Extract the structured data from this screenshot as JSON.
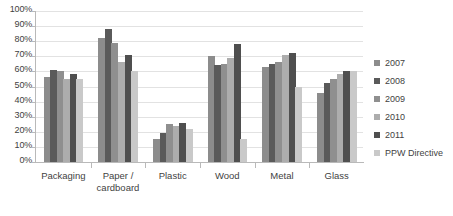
{
  "chart_data": {
    "type": "bar",
    "title": "",
    "xlabel": "",
    "ylabel": "",
    "ylim": [
      0,
      100
    ],
    "y_tick_format": "percent",
    "grid": true,
    "legend_position": "right",
    "categories": [
      "Packaging",
      "Paper / cardboard",
      "Plastic",
      "Wood",
      "Metal",
      "Glass"
    ],
    "category_lines": [
      [
        "Packaging"
      ],
      [
        "Paper /",
        "cardboard"
      ],
      [
        "Plastic"
      ],
      [
        "Wood"
      ],
      [
        "Metal"
      ],
      [
        "Glass"
      ]
    ],
    "y_ticks": [
      "0%",
      "10%",
      "20%",
      "30%",
      "40%",
      "50%",
      "60%",
      "70%",
      "80%",
      "90%",
      "100%"
    ],
    "series": [
      {
        "name": "2007",
        "color": "#8c8c8c",
        "values": [
          56,
          82,
          15,
          70,
          63,
          46
        ]
      },
      {
        "name": "2008",
        "color": "#5a5a5a",
        "values": [
          61,
          88,
          19,
          64,
          65,
          52
        ]
      },
      {
        "name": "2009",
        "color": "#8f8f8f",
        "values": [
          60,
          79,
          25,
          65,
          66,
          55
        ]
      },
      {
        "name": "2010",
        "color": "#adadad",
        "values": [
          55,
          66,
          24,
          69,
          71,
          58
        ]
      },
      {
        "name": "2011",
        "color": "#4f4f4f",
        "values": [
          58,
          71,
          26,
          78,
          72,
          60
        ]
      },
      {
        "name": "PPW Directive",
        "color": "#c9c9c9",
        "values": [
          55,
          60,
          22,
          15,
          50,
          60
        ]
      }
    ]
  },
  "legend": {
    "items": [
      {
        "label": "2007",
        "color": "#8c8c8c"
      },
      {
        "label": "2008",
        "color": "#5a5a5a"
      },
      {
        "label": "2009",
        "color": "#8f8f8f"
      },
      {
        "label": "2010",
        "color": "#adadad"
      },
      {
        "label": "2011",
        "color": "#4f4f4f"
      },
      {
        "label": "PPW Directive",
        "color": "#c9c9c9"
      }
    ]
  }
}
